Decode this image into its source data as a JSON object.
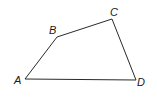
{
  "figure": {
    "type": "quadrilateral",
    "vertices": [
      {
        "name": "A",
        "x": 25,
        "y": 79,
        "label_x": 14,
        "label_y": 84
      },
      {
        "name": "B",
        "x": 57,
        "y": 37,
        "label_x": 49,
        "label_y": 34
      },
      {
        "name": "C",
        "x": 112,
        "y": 19,
        "label_x": 110,
        "label_y": 16
      },
      {
        "name": "D",
        "x": 136,
        "y": 80,
        "label_x": 137,
        "label_y": 86
      }
    ],
    "edges": [
      "AB",
      "BC",
      "CD",
      "DA"
    ]
  }
}
